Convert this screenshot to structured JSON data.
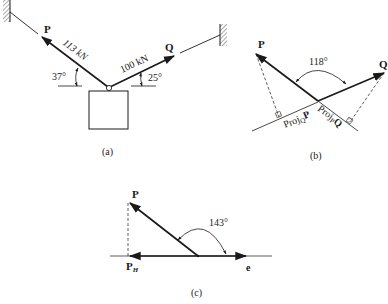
{
  "figure_a": {
    "caption": "(a)",
    "vector_p": {
      "label": "P",
      "magnitude": "113 kN",
      "angle": "37°"
    },
    "vector_q": {
      "label": "Q",
      "magnitude": "100 kN",
      "angle": "25°"
    }
  },
  "figure_b": {
    "caption": "(b)",
    "vector_p": {
      "label": "P"
    },
    "vector_q": {
      "label": "Q"
    },
    "angle": "118°",
    "proj_q_p": {
      "base": "Proj",
      "sub": "Q",
      "tail": "P"
    },
    "proj_p_q": {
      "base": "Proj",
      "sub": "P",
      "tail": "Q"
    }
  },
  "figure_c": {
    "caption": "(c)",
    "vector_p": {
      "label": "P"
    },
    "component": {
      "base": "P",
      "sub": "H"
    },
    "axis_label": "e",
    "angle": "143°"
  },
  "colors": {
    "ink": "#1a1a1a",
    "hatch": "#555555"
  }
}
